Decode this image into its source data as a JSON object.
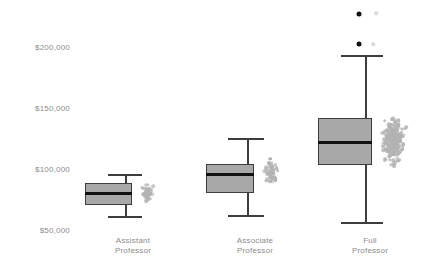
{
  "chart_data": {
    "type": "boxplot",
    "title": "",
    "xlabel": "",
    "ylabel": "",
    "categories": [
      "Assistant\nProfessor",
      "Associate\nProfessor",
      "Full\nProfessor"
    ],
    "ytick_labels": [
      "$200,000",
      "$150,000",
      "$100,000",
      "$50,000"
    ],
    "ytick_values": [
      200000,
      150000,
      100000,
      50000
    ],
    "ylim": [
      42000,
      215000
    ],
    "grid": false,
    "legend": null,
    "colors": {
      "box_fill": "#a8a8a8",
      "box_edge": "#3d3d3d",
      "median": "#111111",
      "jitter_point": "#b3b3b3",
      "outlier": "#111111",
      "tick_text": "#8c8c8c",
      "background": "#ffffff"
    },
    "boxes": [
      {
        "category": "Assistant Professor",
        "min_whisker": 85000,
        "q1": 69000,
        "median": 80000,
        "q3": 90000,
        "max_whisker": 107000,
        "whisker_low": 65000,
        "whisker_high": 107000,
        "outliers": []
      },
      {
        "category": "Associate Professor",
        "q1": 81000,
        "median": 97000,
        "q3": 104000,
        "whisker_low": 66000,
        "whisker_high": 129000,
        "outliers": []
      },
      {
        "category": "Full Professor",
        "q1": 105000,
        "median": 123000,
        "q3": 143000,
        "whisker_low": 57000,
        "whisker_high": 194000,
        "outliers": [
          205000,
          231000
        ]
      }
    ],
    "series_note": "Gray jittered points show individual salary observations per rank"
  },
  "axis": {
    "y_label_right_edge_px": 70,
    "y_200k_px": 47,
    "y_50k_px": 230
  }
}
